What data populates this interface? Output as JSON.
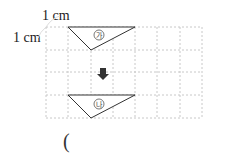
{
  "labels": {
    "unit_horizontal": "1 cm",
    "unit_vertical": "1 cm",
    "shape_top": "가",
    "shape_bottom": "나",
    "answer_open_paren": "("
  },
  "grid": {
    "cols": 7,
    "rows": 4,
    "cell_px": 22.3,
    "line_color": "#c8c8c8"
  },
  "shapes": [
    {
      "name": "ga",
      "points": [
        [
          1,
          0
        ],
        [
          4,
          0
        ],
        [
          2,
          1
        ]
      ]
    },
    {
      "name": "na",
      "points": [
        [
          1,
          3
        ],
        [
          4,
          3
        ],
        [
          2,
          4
        ]
      ]
    }
  ]
}
